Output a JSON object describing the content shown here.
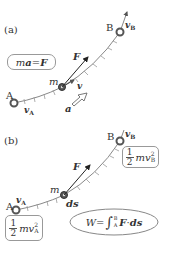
{
  "panel_a": {
    "label": "(a)",
    "point_a": "A",
    "point_b": "B",
    "mass": "m",
    "v_a": "v",
    "v_a_sub": "A",
    "v_b": "v",
    "v_b_sub": "B",
    "velocity": "v",
    "force": "F",
    "accel": "a",
    "equation": {
      "lhs_m": "m",
      "lhs_a": "a",
      "eq": "=",
      "rhs": "F"
    }
  },
  "panel_b": {
    "label": "(b)",
    "point_a": "A",
    "point_b": "B",
    "mass": "m",
    "v_a": "v",
    "v_a_sub": "A",
    "v_b": "v",
    "v_b_sub": "B",
    "force": "F",
    "ds": "ds",
    "ke_a": {
      "num": "1",
      "den": "2",
      "body": "mv",
      "sub": "A",
      "sup": "2"
    },
    "ke_b": {
      "num": "1",
      "den": "2",
      "body": "mv",
      "sub": "B",
      "sup": "2"
    },
    "work": {
      "lhs": "W",
      "eq": "=",
      "int": "∫",
      "lower": "A",
      "upper": "B",
      "F": "F",
      "dot": "·",
      "ds": "ds"
    }
  },
  "colors": {
    "curve": "#7a7a7a",
    "tick": "#888888",
    "arrow": "#222222",
    "point": "#444444",
    "box_border": "#999999"
  }
}
